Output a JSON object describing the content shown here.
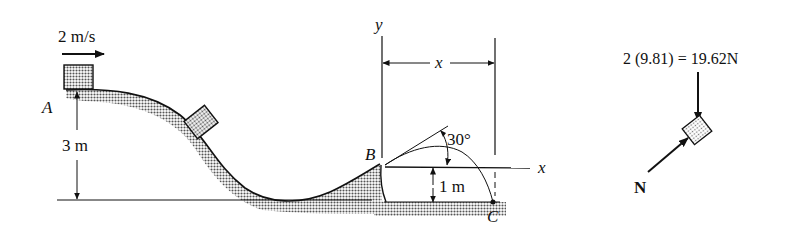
{
  "diagram": {
    "velocity_label": "2 m/s",
    "point_a": "A",
    "point_b": "B",
    "point_c": "C",
    "height_a": "3 m",
    "height_b": "1 m",
    "angle": "30°",
    "axis_y": "y",
    "axis_x": "x",
    "distance_x": "x"
  },
  "free_body_diagram": {
    "weight_label": "2 (9.81) = 19.62N",
    "normal_label": "N"
  },
  "colors": {
    "ink": "#111111",
    "shade": "#8a8a8a"
  }
}
